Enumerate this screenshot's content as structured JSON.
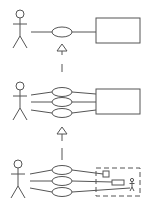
{
  "diagram": {
    "type": "use-case-refinement",
    "width": 150,
    "height": 214,
    "colors": {
      "line": "#555555",
      "background": "#ffffff"
    },
    "levels": [
      {
        "name": "level-1",
        "actor": {
          "x": 20,
          "head_y": 15
        },
        "use_cases": [
          {
            "cx": 62,
            "cy": 32
          }
        ],
        "system_box": {
          "x": 96,
          "y": 18,
          "w": 44,
          "h": 25,
          "style": "solid"
        }
      },
      {
        "name": "level-2",
        "actor": {
          "x": 20,
          "head_y": 85
        },
        "use_cases": [
          {
            "cx": 62,
            "cy": 92
          },
          {
            "cx": 62,
            "cy": 102
          },
          {
            "cx": 62,
            "cy": 113
          }
        ],
        "system_box": {
          "x": 96,
          "y": 89,
          "w": 44,
          "h": 25,
          "style": "solid"
        }
      },
      {
        "name": "level-3",
        "actor": {
          "x": 18,
          "head_y": 165
        },
        "use_cases": [
          {
            "cx": 62,
            "cy": 170
          },
          {
            "cx": 62,
            "cy": 181
          },
          {
            "cx": 62,
            "cy": 192
          }
        ],
        "system_box": {
          "x": 96,
          "y": 168,
          "w": 44,
          "h": 28,
          "style": "dashed"
        },
        "inner_elements": [
          "small-square-component",
          "small-rect-component",
          "small-actor"
        ]
      }
    ],
    "arrows": [
      {
        "from": "level-2",
        "to": "level-1",
        "kind": "generalization-dashed"
      },
      {
        "from": "level-3",
        "to": "level-2",
        "kind": "generalization-dashed"
      }
    ]
  }
}
